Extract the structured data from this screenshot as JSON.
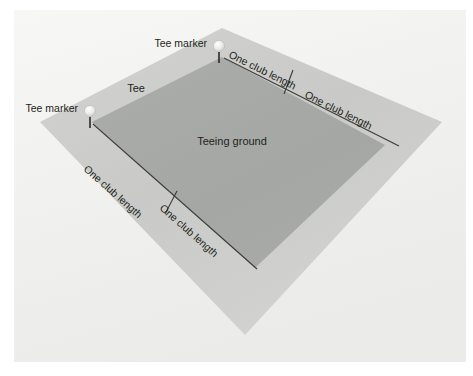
{
  "figure": {
    "name": "golf-teeing-ground-diagram"
  },
  "colors": {
    "background": "#f2f2f0",
    "page": "#ffffff",
    "tee_apron": "#c8c9c6",
    "tee_apron_light": "#d9dad7",
    "teeing_ground": "#a7a9a6",
    "label_text": "#231f20",
    "rule_line": "#3c3c3c",
    "marker_ball": "#f0f0ee",
    "marker_stem": "#2a2a2a"
  },
  "labels": {
    "teeing_ground": "Teeing ground",
    "tee": "Tee",
    "tee_marker_top": "Tee marker",
    "tee_marker_left": "Tee marker",
    "club_length_top_near": "One club length",
    "club_length_top_far": "One club length",
    "club_length_left_near": "One club length",
    "club_length_left_far": "One club length"
  },
  "geometry": {
    "outer_polygon_points": "222,28 442,122 245,335 40,122",
    "inner_polygon_points": "222,57 385,145 255,268 92,122",
    "top_edge_rule": "224,58 398,145",
    "left_edge_rule": "93,124 256,268",
    "tick_top": "285,92 292,72",
    "tick_left": "167,212 176,193"
  },
  "markers": [
    {
      "name": "tee-marker-top",
      "cx": 219,
      "cy": 48,
      "stem_x": 219,
      "stem_y1": 53,
      "stem_y2": 62
    },
    {
      "name": "tee-marker-left",
      "cx": 90,
      "cy": 113,
      "stem_x": 90,
      "stem_y1": 118,
      "stem_y2": 127
    }
  ],
  "text_placements": {
    "teeing_ground": {
      "x": 232,
      "y": 145,
      "rotate": 0,
      "size": 11
    },
    "tee": {
      "x": 135,
      "y": 91,
      "rotate": 0,
      "size": 11
    },
    "tee_marker_top": {
      "x": 154,
      "y": 47,
      "rotate": 0,
      "size": 10.5
    },
    "tee_marker_left": {
      "x": 24,
      "y": 112,
      "rotate": 0,
      "size": 10.5
    },
    "club_length_top_near": {
      "x": 228,
      "y": 58,
      "rotate": 27,
      "size": 10.5
    },
    "club_length_top_far": {
      "x": 306,
      "y": 98,
      "rotate": 27,
      "size": 10.5
    },
    "club_length_left_near": {
      "x": 82,
      "y": 172,
      "rotate": 41,
      "size": 10.5
    },
    "club_length_left_far": {
      "x": 158,
      "y": 211,
      "rotate": 41,
      "size": 10.5
    }
  }
}
